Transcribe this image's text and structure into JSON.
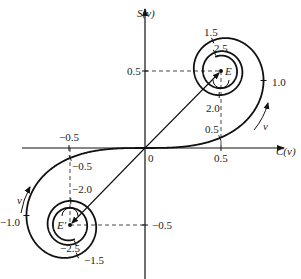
{
  "diagram": {
    "x_axis_label": "C(v)",
    "y_axis_label": "S(v)",
    "origin_label": "0",
    "axis_ticks": {
      "x": [
        {
          "value": -0.5,
          "label": "−0.5"
        },
        {
          "value": 0.5,
          "label": "0.5"
        }
      ],
      "y": [
        {
          "value": 0.5,
          "label": "0.5"
        },
        {
          "value": -0.5,
          "label": "−0.5"
        }
      ]
    },
    "points": {
      "E": {
        "label": "E",
        "C": 0.5,
        "S": 0.5
      },
      "E_prime": {
        "label": "E′",
        "C": -0.5,
        "S": -0.5
      }
    },
    "spiral_v_labels_positive": [
      {
        "v": 0.5,
        "label": "0.5"
      },
      {
        "v": 1.0,
        "label": "1.0"
      },
      {
        "v": 1.5,
        "label": "1.5"
      },
      {
        "v": 2.0,
        "label": "2.0"
      },
      {
        "v": 2.5,
        "label": "2.5"
      }
    ],
    "spiral_v_labels_negative": [
      {
        "v": -0.5,
        "label": "−0.5"
      },
      {
        "v": -1.0,
        "label": "−1.0"
      },
      {
        "v": -1.5,
        "label": "−1.5"
      },
      {
        "v": -2.0,
        "label": "−2.0"
      },
      {
        "v": -2.5,
        "label": "−2.5"
      }
    ],
    "direction_label": "v",
    "colors": {
      "line": "#111111",
      "dashed": "#333333",
      "background": "#ffffff"
    }
  }
}
